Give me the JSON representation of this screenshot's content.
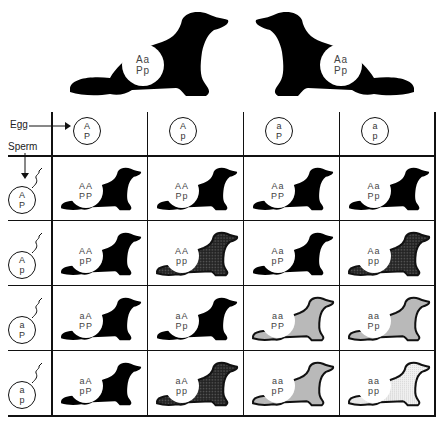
{
  "parents": [
    {
      "id": "left",
      "genotype_line1": "Aa",
      "genotype_line2": "Pp",
      "phenotype": "black",
      "facing": "right"
    },
    {
      "id": "right",
      "genotype_line1": "Aa",
      "genotype_line2": "Pp",
      "phenotype": "black",
      "facing": "left"
    }
  ],
  "labels": {
    "egg": "Egg",
    "sperm": "Sperm"
  },
  "eggs": [
    {
      "line1": "A",
      "line2": "P"
    },
    {
      "line1": "A",
      "line2": "p"
    },
    {
      "line1": "a",
      "line2": "P"
    },
    {
      "line1": "a",
      "line2": "p"
    }
  ],
  "sperm": [
    {
      "line1": "A",
      "line2": "P"
    },
    {
      "line1": "A",
      "line2": "p"
    },
    {
      "line1": "a",
      "line2": "P"
    },
    {
      "line1": "a",
      "line2": "p"
    }
  ],
  "phenotype_colors": {
    "black": "#000000",
    "dark_stipple": "#3a3a3a",
    "light_stipple": "#b8b8b8",
    "very_light_stipple": "#e6e6e6"
  },
  "offspring": [
    [
      {
        "line1": "AA",
        "line2": "PP",
        "phenotype": "black"
      },
      {
        "line1": "AA",
        "line2": "Pp",
        "phenotype": "black"
      },
      {
        "line1": "Aa",
        "line2": "PP",
        "phenotype": "black"
      },
      {
        "line1": "Aa",
        "line2": "Pp",
        "phenotype": "black"
      }
    ],
    [
      {
        "line1": "AA",
        "line2": "pP",
        "phenotype": "black"
      },
      {
        "line1": "AA",
        "line2": "pp",
        "phenotype": "dark_stipple"
      },
      {
        "line1": "Aa",
        "line2": "pP",
        "phenotype": "black"
      },
      {
        "line1": "Aa",
        "line2": "pp",
        "phenotype": "dark_stipple"
      }
    ],
    [
      {
        "line1": "aA",
        "line2": "PP",
        "phenotype": "black"
      },
      {
        "line1": "aA",
        "line2": "Pp",
        "phenotype": "black"
      },
      {
        "line1": "aa",
        "line2": "PP",
        "phenotype": "light_stipple"
      },
      {
        "line1": "aa",
        "line2": "Pp",
        "phenotype": "light_stipple"
      }
    ],
    [
      {
        "line1": "aA",
        "line2": "pP",
        "phenotype": "black"
      },
      {
        "line1": "aA",
        "line2": "pp",
        "phenotype": "dark_stipple"
      },
      {
        "line1": "aa",
        "line2": "pP",
        "phenotype": "light_stipple"
      },
      {
        "line1": "aa",
        "line2": "pp",
        "phenotype": "very_light_stipple"
      }
    ]
  ]
}
